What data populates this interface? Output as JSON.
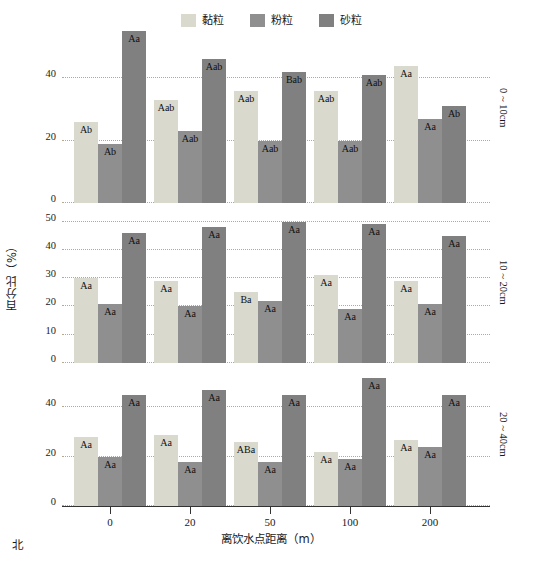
{
  "legend": {
    "items": [
      {
        "label": "黏粒",
        "color": "#d9d9ce",
        "key": "clay"
      },
      {
        "label": "粉粒",
        "color": "#8f8f8f",
        "key": "silt"
      },
      {
        "label": "砂粒",
        "color": "#808080",
        "key": "sand"
      }
    ]
  },
  "axes": {
    "ylabel": "百分比（%）",
    "xlabel": "离饮水点距离（m）",
    "corner_note": "北"
  },
  "panels": [
    {
      "depth_label": "0 ~ 10cm",
      "yticks": [
        "0",
        "20",
        "40"
      ]
    },
    {
      "depth_label": "10 ~ 20cm",
      "yticks": [
        "0",
        "10",
        "20",
        "30",
        "40",
        "50"
      ]
    },
    {
      "depth_label": "20 ~ 40cm",
      "yticks": [
        "0",
        "20",
        "40"
      ]
    }
  ],
  "chart_data": {
    "type": "bar",
    "title": "",
    "xlabel": "离饮水点距离（m）",
    "ylabel": "百分比（%）",
    "categories": [
      "0",
      "20",
      "50",
      "100",
      "200"
    ],
    "grid": true,
    "legend_position": "top-center",
    "panels": [
      {
        "name": "0 ~ 10cm",
        "ylim": [
          0,
          56
        ],
        "yticks": [
          0,
          20,
          40
        ],
        "series": [
          {
            "name": "黏粒",
            "color": "#d9d9ce",
            "values": [
              26,
              33,
              36,
              36,
              44
            ],
            "labels": [
              "Ab",
              "Aab",
              "Aab",
              "Aab",
              "Aa"
            ]
          },
          {
            "name": "粉粒",
            "color": "#8f8f8f",
            "values": [
              19,
              23,
              20,
              20,
              27
            ],
            "labels": [
              "Ab",
              "Aab",
              "Aab",
              "Aab",
              "Aa"
            ]
          },
          {
            "name": "砂粒",
            "color": "#808080",
            "values": [
              55,
              46,
              42,
              41,
              31
            ],
            "labels": [
              "Aa",
              "Aab",
              "Bab",
              "Aab",
              "Ab"
            ]
          }
        ]
      },
      {
        "name": "10 ~ 20cm",
        "ylim": [
          0,
          53
        ],
        "yticks": [
          0,
          10,
          20,
          30,
          40,
          50
        ],
        "series": [
          {
            "name": "黏粒",
            "color": "#d9d9ce",
            "values": [
              30,
              29,
              25,
              31,
              29
            ],
            "labels": [
              "Aa",
              "Aa",
              "Ba",
              "Aa",
              "Aa"
            ]
          },
          {
            "name": "粉粒",
            "color": "#8f8f8f",
            "values": [
              21,
              20,
              22,
              19,
              21
            ],
            "labels": [
              "Aa",
              "Aa",
              "Aa",
              "Aa",
              "Aa"
            ]
          },
          {
            "name": "砂粒",
            "color": "#808080",
            "values": [
              46,
              48,
              50,
              49,
              45
            ],
            "labels": [
              "Aa",
              "Aa",
              "Aa",
              "Aa",
              "Aa"
            ]
          }
        ]
      },
      {
        "name": "20 ~ 40cm",
        "ylim": [
          0,
          54
        ],
        "yticks": [
          0,
          20,
          40
        ],
        "series": [
          {
            "name": "黏粒",
            "color": "#d9d9ce",
            "values": [
              28,
              29,
              26,
              22,
              27
            ],
            "labels": [
              "Aa",
              "Aa",
              "ABa",
              "Aa",
              "Aa"
            ]
          },
          {
            "name": "粉粒",
            "color": "#8f8f8f",
            "values": [
              20,
              18,
              18,
              19,
              24
            ],
            "labels": [
              "Aa",
              "Aa",
              "Aa",
              "Aa",
              "Aa"
            ]
          },
          {
            "name": "砂粒",
            "color": "#808080",
            "values": [
              45,
              47,
              45,
              52,
              45
            ],
            "labels": [
              "Aa",
              "Aa",
              "Aa",
              "Aa",
              "Aa"
            ]
          }
        ]
      }
    ]
  }
}
